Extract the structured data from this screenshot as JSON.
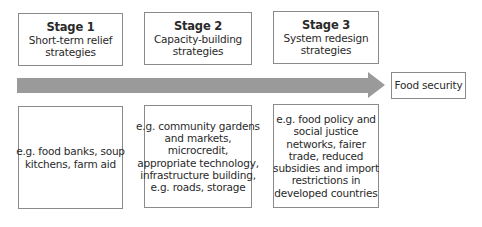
{
  "stages": [
    {
      "title": "Stage 1",
      "subtitle_lines": [
        "Short-term relief",
        "strategies"
      ],
      "examples_lines": [
        "e.g. food banks, soup",
        "kitchens, farm aid"
      ]
    },
    {
      "title": "Stage 2",
      "subtitle_lines": [
        "Capacity-building",
        "strategies"
      ],
      "examples_lines": [
        "e.g. community gardens",
        "and markets,",
        "microcredit,",
        "appropriate technology,",
        "infrastructure building,",
        "e.g. roads, storage"
      ]
    },
    {
      "title": "Stage 3",
      "subtitle_lines": [
        "System redesign",
        "strategies"
      ],
      "examples_lines": [
        "e.g. food policy and",
        "social justice",
        "networks, fairer",
        "trade, reduced",
        "subsidies and import",
        "restrictions in",
        "developed countries"
      ]
    }
  ],
  "goal": {
    "label": "Food security"
  },
  "arrow": {
    "color": "#9a9a9a",
    "icon": "right-arrow"
  }
}
